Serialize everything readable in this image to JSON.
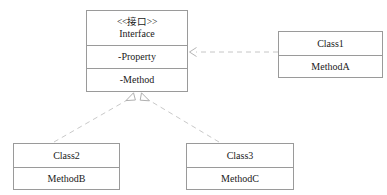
{
  "diagram": {
    "kind": "uml-class-diagram",
    "background_color": "#ffffff",
    "border_color": "#9a9a9a",
    "edge_color": "#bfbfbf",
    "text_color": "#1a1a1a",
    "classes": [
      {
        "id": "interface",
        "stereotype": "<<接口>>",
        "name": "Interface",
        "property": "-Property",
        "method": "-Method"
      },
      {
        "id": "class1",
        "name": "Class1",
        "method": "MethodA"
      },
      {
        "id": "class2",
        "name": "Class2",
        "method": "MethodB"
      },
      {
        "id": "class3",
        "name": "Class3",
        "method": "MethodC"
      }
    ],
    "relations": [
      {
        "id": "class1-realizes-interface",
        "from": "class1",
        "to": "interface",
        "type": "realization",
        "line": "dashed",
        "arrowhead": "open-arrow"
      },
      {
        "id": "class2-realizes-interface",
        "from": "class2",
        "to": "interface",
        "type": "realization",
        "line": "dashed",
        "arrowhead": "hollow-triangle"
      },
      {
        "id": "class3-realizes-interface",
        "from": "class3",
        "to": "interface",
        "type": "realization",
        "line": "dashed",
        "arrowhead": "hollow-triangle"
      }
    ]
  }
}
